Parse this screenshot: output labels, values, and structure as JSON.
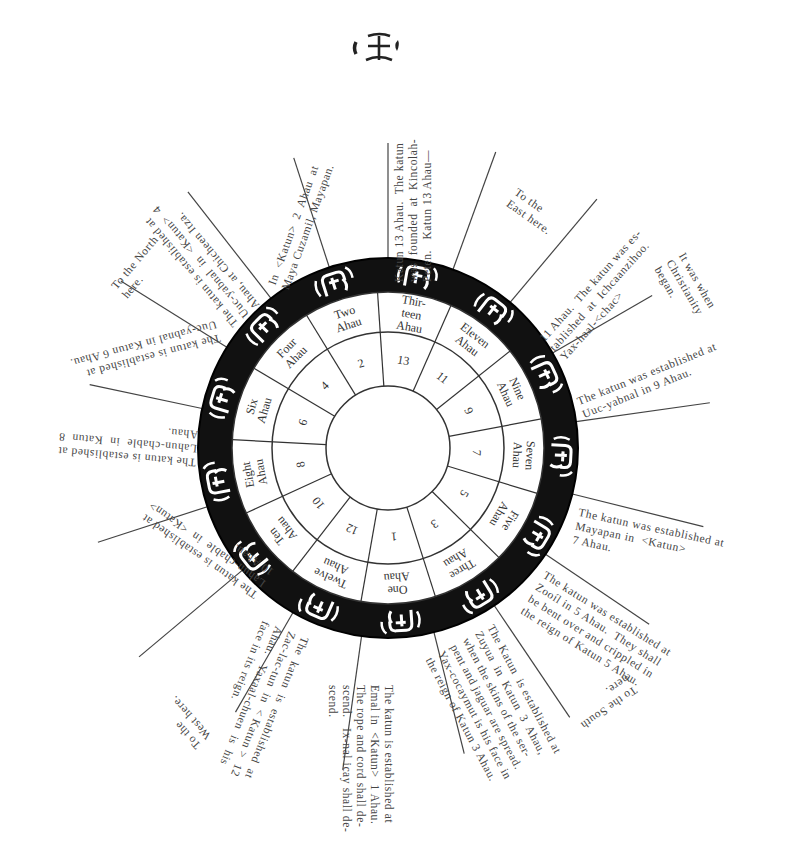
{
  "header": {
    "top_glyph_label": "glyph"
  },
  "wheel": {
    "center": [
      388,
      448
    ],
    "radii": {
      "outer": 190,
      "glyph_inner": 156,
      "name_inner": 116,
      "number_inner": 62
    },
    "segments": [
      {
        "name": "Thir-\nteen\nAhau",
        "number": "13"
      },
      {
        "name": "Eleven\nAhau",
        "number": "11"
      },
      {
        "name": "Nine\nAhau",
        "number": "9"
      },
      {
        "name": "Seven\nAhau",
        "number": "7"
      },
      {
        "name": "Five\nAhau",
        "number": "5"
      },
      {
        "name": "Three\nAhau",
        "number": "3"
      },
      {
        "name": "One\nAhau",
        "number": "1"
      },
      {
        "name": "Twelve\nAhau",
        "number": "12"
      },
      {
        "name": "Ten\nAhau",
        "number": "10"
      },
      {
        "name": "Eight\nAhau",
        "number": "8"
      },
      {
        "name": "Six\nAhau",
        "number": "6"
      },
      {
        "name": "Four\nAhau",
        "number": "4"
      },
      {
        "name": "Two\nAhau",
        "number": "2"
      }
    ],
    "colors": {
      "band": "#111111",
      "line": "#333333",
      "glyph": "#ffffff"
    }
  },
  "annotations": [
    {
      "id": "katun-2",
      "text": "In  <Katun>  2  Ahau  at\nMaya Cuzamil, Mayapan."
    },
    {
      "id": "katun-13",
      "text": "Katun 13 Ahau.  The katun\nwas  founded  at  Kincolah-\nPeten.   Katun 13 Ahau—"
    },
    {
      "id": "east",
      "text": "To the\nEast here."
    },
    {
      "id": "katun-11",
      "text": "11 Ahau.  The katun was es-\ntablished  at  Ichcaanzihoo.\nYax-haal-<chac>"
    },
    {
      "id": "christianity",
      "text": "It was when\nChristianity\nbegan."
    },
    {
      "id": "katun-9",
      "text": "The katun was established at\nUuc-yabnal in 9 Ahau."
    },
    {
      "id": "katun-7",
      "text": "The katun was established at\nMayapan in  <Katun>\n7 Ahau."
    },
    {
      "id": "katun-5",
      "text": "The katun was established at\nZooíl in 5 Ahau.  They shall\nbe bent over and crippled in\nthe reign of Katun 5 Ahau."
    },
    {
      "id": "south",
      "text": "To the South\nhere."
    },
    {
      "id": "katun-3",
      "text": "The Katun  is established at\nZuyua  in  Katun  3  Ahau,\nwhen the skins of the ser-\npent and jaguar are spread.\nYax-cocaymut is his face in\nthe reign of Katun 3 Ahau."
    },
    {
      "id": "katun-1",
      "text": "The katun is established at\nEmal in  <Katun>  1 Ahau.\nThe rope and cord shall de-\nscend.   Ix-nal icay shall de-\nscend."
    },
    {
      "id": "katun-12",
      "text": "The  katun  is  established  at\nZac-lac-tun  in  < Katun >  12\nAhau.   Yaxaal-chuen  is  his\nface in its reign."
    },
    {
      "id": "west",
      "text": "To the\nWest here."
    },
    {
      "id": "katun-10",
      "text": "The katun is established at\nLahun-chable  in  <Katun>\n10 Ahau."
    },
    {
      "id": "katun-8",
      "text": "The katun is established at\nLahun-chable  in  Katun  8\nAhau."
    },
    {
      "id": "katun-6",
      "text": "The katun is established at\nUuc-yabnal in Katun 6 Ahau."
    },
    {
      "id": "north",
      "text": "To the North\nhere."
    },
    {
      "id": "katun-4",
      "text": "The katun is established at\nUuc-yabnal  in  <Katun>  4\nAhau, at Chicheen Itza."
    }
  ]
}
